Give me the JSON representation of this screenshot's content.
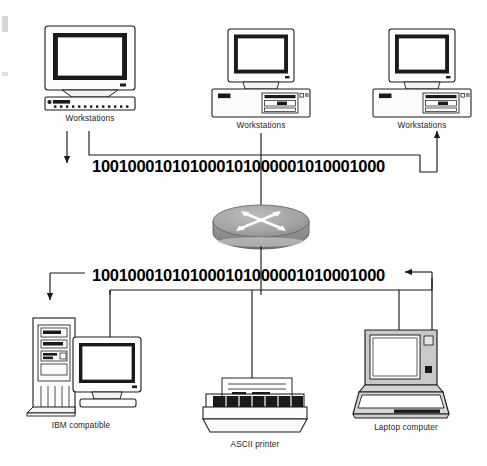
{
  "diagram": {
    "type": "network-topology"
  },
  "binary_streams": {
    "upper": "100100010101000101000001010001000",
    "lower": "100100010101000101000001010001000"
  },
  "nodes": {
    "top": [
      {
        "id": "workstation-1",
        "label": "Workstations",
        "device": "crt-monitor-keyboard"
      },
      {
        "id": "workstation-2",
        "label": "Workstations",
        "device": "crt-monitor-desktop-case"
      },
      {
        "id": "workstation-3",
        "label": "Workstations",
        "device": "crt-monitor-desktop-case"
      }
    ],
    "center": {
      "id": "router",
      "label": "",
      "device": "router-puck"
    },
    "bottom": [
      {
        "id": "ibm-compatible",
        "label": "IBM compatible",
        "device": "tower-pc-monitor"
      },
      {
        "id": "ascii-printer",
        "label": "ASCII printer",
        "device": "dot-matrix-printer"
      },
      {
        "id": "laptop-computer",
        "label": "Laptop computer",
        "device": "laptop"
      }
    ]
  },
  "colors": {
    "line": "#1a1a1a",
    "router_body": "#8c8c8c",
    "router_top": "#a8a8a8",
    "screen_fill": "#ffffff",
    "case_fill": "#fbfbfb",
    "laptop_fill": "#c8c8c8",
    "text": "#1c1c1c"
  }
}
